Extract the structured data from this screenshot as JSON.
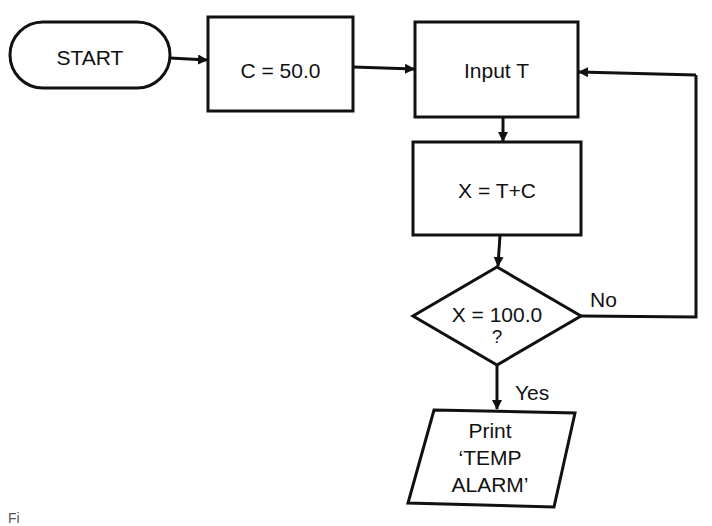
{
  "flowchart": {
    "start": {
      "label": "START"
    },
    "init": {
      "label": "C = 50.0"
    },
    "input": {
      "label": "Input T"
    },
    "compute": {
      "label": "X = T+C"
    },
    "decision": {
      "line1": "X = 100.0",
      "line2": "?"
    },
    "output": {
      "line1": "Print",
      "line2": "‘TEMP",
      "line3": "ALARM’"
    },
    "edges": {
      "no_label": "No",
      "yes_label": "Yes"
    }
  },
  "caption": {
    "text": "Fi"
  },
  "colors": {
    "stroke": "#111111",
    "background": "#ffffff"
  }
}
